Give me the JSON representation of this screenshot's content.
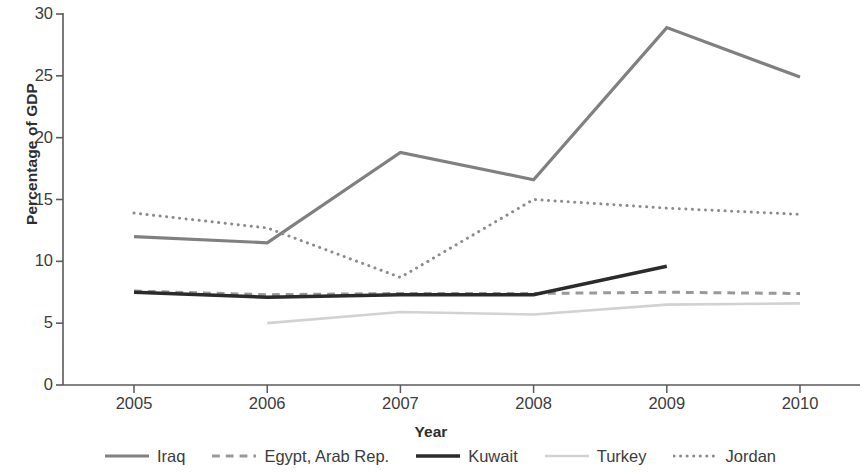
{
  "chart_data": {
    "type": "line",
    "title": "",
    "xlabel": "Year",
    "ylabel": "Percentage of GDP",
    "categories": [
      "2005",
      "2006",
      "2007",
      "2008",
      "2009",
      "2010"
    ],
    "x": [
      2005,
      2006,
      2007,
      2008,
      2009,
      2010
    ],
    "xlim": [
      2005,
      2010
    ],
    "ylim": [
      0,
      30
    ],
    "ytick_labels": [
      "0",
      "5",
      "10",
      "15",
      "20",
      "25",
      "30"
    ],
    "yticks": [
      0,
      5,
      10,
      15,
      20,
      25,
      30
    ],
    "grid": false,
    "legend_position": "bottom",
    "series": [
      {
        "name": "Iraq",
        "style": "solid",
        "color": "#808080",
        "width": 3.2,
        "values": [
          12.0,
          11.5,
          18.8,
          16.6,
          28.9,
          24.9
        ]
      },
      {
        "name": "Egypt, Arab Rep.",
        "style": "dashed",
        "color": "#999999",
        "width": 3.0,
        "values": [
          7.6,
          7.3,
          7.4,
          7.4,
          7.5,
          7.4
        ]
      },
      {
        "name": "Kuwait",
        "style": "solid",
        "color": "#2b2b2b",
        "width": 3.4,
        "values": [
          7.5,
          7.1,
          7.3,
          7.3,
          9.6,
          null
        ]
      },
      {
        "name": "Turkey",
        "style": "solid",
        "color": "#d2d2d2",
        "width": 2.6,
        "values": [
          null,
          5.0,
          5.9,
          5.7,
          6.5,
          6.6
        ]
      },
      {
        "name": "Jordan",
        "style": "dotted",
        "color": "#8c8c8c",
        "width": 3.0,
        "values": [
          13.9,
          12.7,
          8.7,
          15.0,
          14.3,
          13.8
        ]
      }
    ]
  },
  "axis": {
    "y_title": "Percentage of GDP",
    "x_title": "Year"
  },
  "legend": {
    "items": [
      {
        "label": "Iraq",
        "icon": "solid-line-swatch"
      },
      {
        "label": "Egypt, Arab Rep.",
        "icon": "dashed-line-swatch"
      },
      {
        "label": "Kuwait",
        "icon": "solid-line-swatch"
      },
      {
        "label": "Turkey",
        "icon": "light-line-swatch"
      },
      {
        "label": "Jordan",
        "icon": "dotted-line-swatch"
      }
    ]
  }
}
